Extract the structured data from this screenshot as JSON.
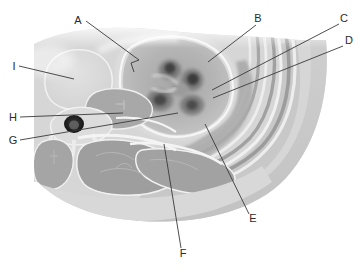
{
  "figure": {
    "kind": "anatomical-cross-section",
    "modality_appearance": "grayscale-ct-like",
    "orientation": "axial-section-through-kidney-and-paraspinal-region",
    "background_color": "#ffffff",
    "width_px": 359,
    "height_px": 269
  },
  "style": {
    "label_color": "#2b2b2b",
    "leader_line_color": "#3a3a3a",
    "leader_line_width": 0.9,
    "label_font_size_px": 11,
    "tissue_light": "#d9d9d9",
    "tissue_mid": "#b9b9b9",
    "tissue_dark": "#8f8f8f",
    "tissue_darkest": "#4a4a4a",
    "fat_plane": "#efefef",
    "outline_stroke": "#f4f4f4"
  },
  "labels": [
    {
      "id": "A",
      "text": "A",
      "text_x": 78,
      "text_y": 24,
      "side": "left",
      "leader": "M 86,21 L 139,60 L 131,63 L 134,72",
      "marker": "bracket"
    },
    {
      "id": "B",
      "text": "B",
      "text_x": 258,
      "text_y": 22,
      "side": "right",
      "leader": "M 256,25 L 208,62",
      "marker": "line"
    },
    {
      "id": "C",
      "text": "C",
      "text_x": 343,
      "text_y": 22,
      "side": "right",
      "leader": "M 341,24 L 212,90",
      "marker": "line"
    },
    {
      "id": "D",
      "text": "D",
      "text_x": 347,
      "text_y": 44,
      "side": "right",
      "leader": "M 345,46 L 213,98",
      "marker": "line"
    },
    {
      "id": "E",
      "text": "E",
      "text_x": 252,
      "text_y": 222,
      "side": "right",
      "leader": "M 250,216 L 205,124",
      "marker": "line"
    },
    {
      "id": "F",
      "text": "F",
      "text_x": 181,
      "text_y": 257,
      "side": "bottom",
      "leader": "M 181,250 L 164,144",
      "marker": "line"
    },
    {
      "id": "G",
      "text": "G",
      "text_x": 11,
      "text_y": 144,
      "side": "left",
      "leader": "M 20,140 L 178,113",
      "marker": "line"
    },
    {
      "id": "H",
      "text": "H",
      "text_x": 11,
      "text_y": 121,
      "side": "left",
      "leader": "M 20,117 L 123,113",
      "marker": "line"
    },
    {
      "id": "I",
      "text": "I",
      "text_x": 14,
      "text_y": 70,
      "side": "left",
      "leader": "M 19,66 L 74,79",
      "marker": "line"
    }
  ]
}
